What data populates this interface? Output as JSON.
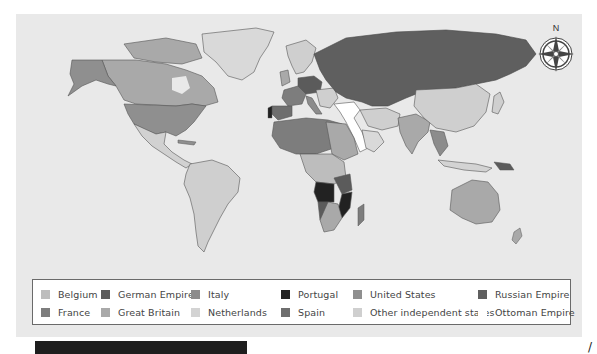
{
  "map": {
    "title_visible": false,
    "compass": {
      "label": "N"
    },
    "ocean_color": "#e9e9e9",
    "territories": [
      {
        "name": "Alaska",
        "holder": "United States"
      },
      {
        "name": "Canada",
        "holder": "Great Britain"
      },
      {
        "name": "Greenland",
        "holder": "Other independent states"
      },
      {
        "name": "USA",
        "holder": "United States"
      },
      {
        "name": "Mexico & Central America",
        "holder": "Other independent states"
      },
      {
        "name": "South America",
        "holder": "Other independent states"
      },
      {
        "name": "Russia",
        "holder": "Russian Empire"
      },
      {
        "name": "China",
        "holder": "Other independent states"
      },
      {
        "name": "India",
        "holder": "Great Britain"
      },
      {
        "name": "Arabian Peninsula",
        "holder": "Ottoman Empire"
      },
      {
        "name": "Australia",
        "holder": "Great Britain"
      },
      {
        "name": "Angola",
        "holder": "Portugal"
      },
      {
        "name": "Mozambique",
        "holder": "Portugal"
      }
    ]
  },
  "legend": {
    "items": [
      {
        "label": "Belgium",
        "color": "#bdbdbd"
      },
      {
        "label": "German Empire",
        "color": "#5b5b5b"
      },
      {
        "label": "Italy",
        "color": "#8c8c8c"
      },
      {
        "label": "Portugal",
        "color": "#222222"
      },
      {
        "label": "United States",
        "color": "#8f8f8f"
      },
      {
        "label": "Russian Empire",
        "color": "#5f5f5f"
      },
      {
        "label": "France",
        "color": "#7d7d7d"
      },
      {
        "label": "Great Britain",
        "color": "#a9a9a9"
      },
      {
        "label": "Netherlands",
        "color": "#d3d3d3"
      },
      {
        "label": "Spain",
        "color": "#6e6e6e"
      },
      {
        "label": "Other independent states",
        "color": "#cfcfcf"
      },
      {
        "label": "Ottoman Empire",
        "color": "#ffffff"
      }
    ]
  }
}
